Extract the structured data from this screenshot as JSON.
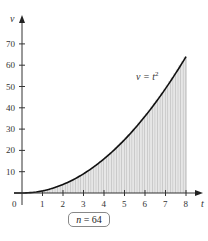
{
  "chart_data": {
    "type": "area",
    "title": "",
    "xlabel": "t",
    "ylabel": "v",
    "function": "v = t^2",
    "curve_label": "v = t²",
    "x_ticks": [
      0,
      1,
      2,
      3,
      4,
      5,
      6,
      7,
      8
    ],
    "y_ticks": [
      10,
      20,
      30,
      40,
      50,
      60,
      70
    ],
    "xlim": [
      0,
      8
    ],
    "ylim": [
      0,
      75
    ],
    "rectangles": 64,
    "x": [
      0,
      1,
      2,
      3,
      4,
      5,
      6,
      7,
      8
    ],
    "values": [
      0,
      1,
      4,
      9,
      16,
      25,
      36,
      49,
      64
    ],
    "grid": false,
    "annotation": "n = 64",
    "fill_style": "vertical stripes (Riemann rectangles)"
  },
  "labels": {
    "origin": "0",
    "x_axis": "t",
    "y_axis": "v",
    "curve": "v = t",
    "curve_exp": "2",
    "n_var": "n",
    "n_eq": " = 64"
  },
  "colors": {
    "curve": "#111111",
    "stripes": "#9a9a9a",
    "fill": "#e6e6e6",
    "axis": "#333333"
  }
}
